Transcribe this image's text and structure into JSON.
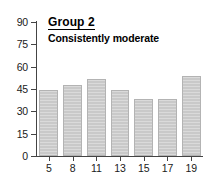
{
  "chart_data": {
    "type": "bar",
    "title": "Group 2",
    "subtitle": "Consistently moderate",
    "xlabel": "",
    "ylabel": "",
    "categories": [
      "5",
      "8",
      "11",
      "13",
      "15",
      "17",
      "19"
    ],
    "values": [
      44,
      48,
      52,
      44.5,
      38.5,
      38,
      54
    ],
    "ylim": [
      0,
      90
    ],
    "yticks": [
      "0",
      "15",
      "30",
      "45",
      "60",
      "75",
      "90"
    ],
    "ytick_values": [
      0,
      15,
      30,
      45,
      60,
      75,
      90
    ],
    "grid": false,
    "legend": "none",
    "bar_color": "#c9c9c9",
    "bar_edge_color": "#b3b3b3",
    "axis_color": "#444444",
    "text_color": "#1a1a1a",
    "series": [
      {
        "name": "Group 2",
        "values": [
          44,
          48,
          52,
          44.5,
          38.5,
          38,
          54
        ]
      }
    ]
  }
}
